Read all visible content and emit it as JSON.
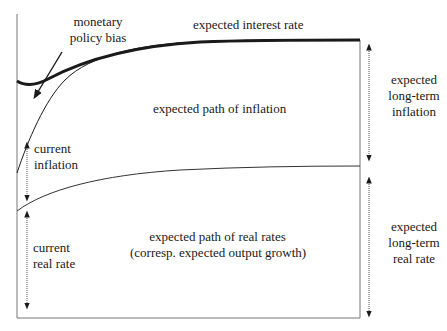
{
  "labels": {
    "monetary_policy_bias": [
      "monetary",
      "policy bias"
    ],
    "expected_interest_rate": "expected interest rate",
    "expected_path_of_inflation": "expected path of inflation",
    "current_inflation": [
      "current",
      "inflation"
    ],
    "expected_long_term_inflation": [
      "expected",
      "long-term",
      "inflation"
    ],
    "current_real_rate": [
      "current",
      "real rate"
    ],
    "expected_path_of_real_rates": [
      "expected path of real rates",
      "(corresp. expected output growth)"
    ],
    "expected_long_term_real_rate": [
      "expected",
      "long-term",
      "real rate"
    ]
  },
  "colors": {
    "line": "#1a1a1a",
    "frame": "#555555",
    "arrow": "#222222"
  }
}
